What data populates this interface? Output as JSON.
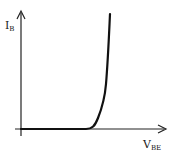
{
  "diagram": {
    "title": "",
    "type": "BJT input characteristic (I_B vs V_BE)",
    "y_axis": {
      "label": "I",
      "label_sub": "B"
    },
    "x_axis": {
      "label": "V",
      "label_sub": "BE"
    },
    "curve": {
      "description": "Base current stays at zero until the knee voltage, then rises exponentially",
      "color": "#111111"
    },
    "colors": {
      "axes": "#222222",
      "curve": "#111111",
      "background": "#ffffff"
    }
  }
}
